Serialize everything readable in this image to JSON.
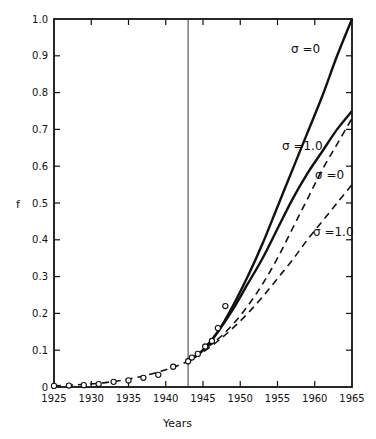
{
  "chart_data": {
    "type": "line",
    "title": "",
    "xlabel": "Years",
    "ylabel": "f",
    "xlim": [
      1925,
      1965
    ],
    "ylim": [
      0,
      1.0
    ],
    "grid": false,
    "legend": "inline curve labels",
    "x_ticks": [
      1925,
      1930,
      1935,
      1940,
      1945,
      1950,
      1955,
      1960,
      1965
    ],
    "x_tick_labels": [
      "1925",
      "1930",
      "1935",
      "1940",
      "1945",
      "1950",
      "1955",
      "1960",
      "1965"
    ],
    "y_ticks": [
      0,
      0.1,
      0.2,
      0.3,
      0.4,
      0.5,
      0.6,
      0.7,
      0.8,
      0.9,
      1.0
    ],
    "y_tick_labels": [
      "0",
      "0.1",
      "0.2",
      "0.3",
      "0.4",
      "0.5",
      "0.6",
      "0.7",
      "0.8",
      "0.9",
      "1.0"
    ],
    "vertical_marker": {
      "x": 1943,
      "style": "thin solid line"
    },
    "series": [
      {
        "name": "σ = 0 (solid)",
        "label": "σ = 0",
        "style": "solid",
        "x": [
          1943,
          1945,
          1947,
          1949,
          1951,
          1953,
          1955,
          1957,
          1959,
          1961,
          1963,
          1965
        ],
        "y": [
          0.07,
          0.1,
          0.15,
          0.22,
          0.3,
          0.39,
          0.49,
          0.59,
          0.69,
          0.79,
          0.9,
          1.0
        ]
      },
      {
        "name": "σ = 1.0 (solid)",
        "label": "σ = 1.0",
        "style": "solid",
        "x": [
          1943,
          1945,
          1947,
          1949,
          1951,
          1953,
          1955,
          1957,
          1959,
          1961,
          1963,
          1965
        ],
        "y": [
          0.07,
          0.1,
          0.15,
          0.21,
          0.28,
          0.35,
          0.43,
          0.51,
          0.58,
          0.64,
          0.7,
          0.75
        ]
      },
      {
        "name": "σ = 0 (dashed)",
        "label": "σ = 0",
        "style": "dashed",
        "x": [
          1943,
          1945,
          1947,
          1949,
          1951,
          1953,
          1955,
          1957,
          1959,
          1961,
          1963,
          1965
        ],
        "y": [
          0.07,
          0.1,
          0.13,
          0.17,
          0.22,
          0.28,
          0.35,
          0.43,
          0.51,
          0.59,
          0.66,
          0.73
        ]
      },
      {
        "name": "σ = 1.0 (dashed)",
        "label": "σ = 1.0",
        "style": "dashed",
        "x": [
          1925,
          1928,
          1931,
          1934,
          1937,
          1940,
          1943,
          1945,
          1947,
          1949,
          1951,
          1953,
          1955,
          1957,
          1959,
          1961,
          1963,
          1965
        ],
        "y": [
          0.003,
          0.006,
          0.01,
          0.018,
          0.03,
          0.047,
          0.07,
          0.095,
          0.125,
          0.16,
          0.2,
          0.245,
          0.295,
          0.345,
          0.4,
          0.45,
          0.5,
          0.55
        ]
      },
      {
        "name": "Observed data",
        "style": "open circles",
        "x": [
          1925,
          1927,
          1929,
          1931,
          1933,
          1935,
          1937,
          1939,
          1941,
          1943,
          1943.5,
          1944.3,
          1945.3,
          1946.2,
          1947,
          1948
        ],
        "y": [
          0.003,
          0.004,
          0.005,
          0.008,
          0.014,
          0.018,
          0.025,
          0.033,
          0.055,
          0.07,
          0.08,
          0.09,
          0.11,
          0.125,
          0.16,
          0.22
        ]
      }
    ],
    "annotations": [
      {
        "text": "σ = 0",
        "x": 1955.5,
        "y": 0.93,
        "refers_to": "σ = 0 (solid)"
      },
      {
        "text": "σ = 1.0",
        "x": 1955.5,
        "y": 0.66,
        "refers_to": "σ = 1.0 (solid)"
      },
      {
        "text": "σ = 0",
        "x": 1960.5,
        "y": 0.57,
        "refers_to": "σ = 0 (dashed)"
      },
      {
        "text": "σ = 1.0",
        "x": 1960.5,
        "y": 0.4,
        "refers_to": "σ = 1.0 (dashed)"
      }
    ]
  },
  "labels": {
    "xlabel": "Years",
    "ylabel": "f",
    "curve_solid_sigma0": "σ =0",
    "curve_solid_sigma1": "σ =1.0",
    "curve_dashed_sigma0": "σ =0",
    "curve_dashed_sigma1": "σ =1.0"
  }
}
